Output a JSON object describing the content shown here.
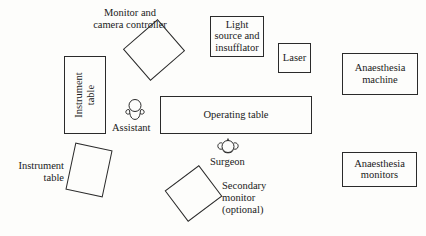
{
  "diagram": {
    "background_color": "#fdfdfb",
    "stroke_color": "#2a2a2a",
    "text_color": "#1a1a1a"
  },
  "equipment": [
    {
      "key": "monitor_and_camera_controller",
      "label": "Monitor and\ncamera controller",
      "shape": "rotated-rectangle"
    },
    {
      "key": "instrument_table_upper",
      "label": "Instrument\ntable",
      "shape": "rectangle-vertical-text"
    },
    {
      "key": "light_source_and_insufflator",
      "label": "Light\nsource and\ninsufflator",
      "shape": "rectangle"
    },
    {
      "key": "laser",
      "label": "Laser",
      "shape": "rectangle"
    },
    {
      "key": "anaesthesia_machine",
      "label": "Anaesthesia\nmachine",
      "shape": "rectangle"
    },
    {
      "key": "operating_table",
      "label": "Operating table",
      "shape": "rectangle"
    },
    {
      "key": "anaesthesia_monitors",
      "label": "Anaesthesia\nmonitors",
      "shape": "rectangle"
    },
    {
      "key": "instrument_table_lower",
      "label": "Instrument\ntable",
      "shape": "rotated-rectangle"
    },
    {
      "key": "secondary_monitor",
      "label": "Secondary\nmonitor\n(optional)",
      "shape": "rotated-rectangle"
    }
  ],
  "people": [
    {
      "key": "assistant",
      "label": "Assistant",
      "icon": "person-top-view-icon"
    },
    {
      "key": "surgeon",
      "label": "Surgeon",
      "icon": "person-top-view-icon"
    }
  ],
  "labels": {
    "monitor_and_camera_controller": "Monitor and\ncamera controller",
    "instrument_table_upper": "Instrument\ntable",
    "light_source_and_insufflator": "Light\nsource and\ninsufflator",
    "laser": "Laser",
    "anaesthesia_machine": "Anaesthesia\nmachine",
    "operating_table": "Operating table",
    "anaesthesia_monitors": "Anaesthesia\nmonitors",
    "instrument_table_lower": "Instrument\ntable",
    "secondary_monitor": "Secondary\nmonitor\n(optional)",
    "assistant": "Assistant",
    "surgeon": "Surgeon"
  }
}
